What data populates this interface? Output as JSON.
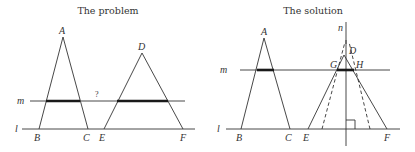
{
  "panels": [
    {
      "id": "problem",
      "title": "The problem",
      "labels": {
        "A": "A",
        "B": "B",
        "C": "C",
        "D": "D",
        "E": "E",
        "F": "F",
        "m": "m",
        "l": "l",
        "question": "?"
      }
    },
    {
      "id": "solution",
      "title": "The solution",
      "labels": {
        "A": "A",
        "B": "B",
        "C": "C",
        "D": "D",
        "E": "E",
        "F": "F",
        "G": "G",
        "H": "H",
        "m": "m",
        "l": "l",
        "n": "n"
      }
    }
  ],
  "colors": {
    "line": "#333333",
    "thick": "#1a1a1a",
    "background": "#ffffff"
  }
}
